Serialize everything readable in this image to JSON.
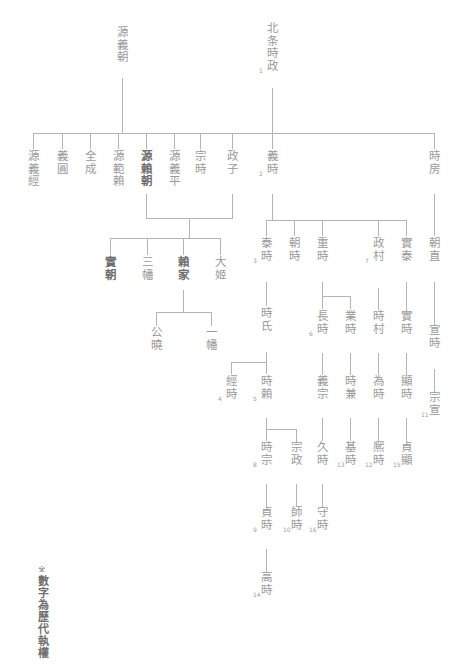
{
  "footnote": {
    "mark": "※",
    "text": "數字為歷代執權"
  },
  "legend": {
    "note": "數字為歷代執權",
    "meaning_marker": "※"
  },
  "colors": {
    "line": "#b4b4b4",
    "text": "#9a9a9a",
    "text_bold": "#6e6e6e",
    "background": "#ffffff"
  },
  "nodes": {
    "minamoto_yoshitomo": {
      "name": "源義朝",
      "number": ""
    },
    "minamoto_yoshitsune": {
      "name": "源義經",
      "number": ""
    },
    "gien": {
      "name": "義圓",
      "number": ""
    },
    "zenjo": {
      "name": "全成",
      "number": ""
    },
    "minamoto_noriyori": {
      "name": "源範賴",
      "number": ""
    },
    "minamoto_yoritomo": {
      "name": "源賴朝",
      "number": ""
    },
    "minamoto_yoshihira": {
      "name": "源義平",
      "number": ""
    },
    "hojo_tokimasa": {
      "name": "北条時政",
      "number": "1"
    },
    "munetoki": {
      "name": "宗時",
      "number": ""
    },
    "masako": {
      "name": "政子",
      "number": ""
    },
    "yoshitoki": {
      "name": "義時",
      "number": "2"
    },
    "tokifusa": {
      "name": "時房",
      "number": ""
    },
    "sanetomo": {
      "name": "實朝",
      "number": ""
    },
    "sanman": {
      "name": "三幡",
      "number": ""
    },
    "yoriie": {
      "name": "賴家",
      "number": ""
    },
    "ohime": {
      "name": "大姬",
      "number": ""
    },
    "kugyo": {
      "name": "公曉",
      "number": ""
    },
    "ichiman": {
      "name": "一幡",
      "number": ""
    },
    "yasutoki": {
      "name": "泰時",
      "number": "3"
    },
    "tomotoki": {
      "name": "朝時",
      "number": ""
    },
    "shigetoki": {
      "name": "重時",
      "number": ""
    },
    "masamura": {
      "name": "政村",
      "number": "7"
    },
    "saneyasu": {
      "name": "實泰",
      "number": ""
    },
    "tokiuji": {
      "name": "時氏",
      "number": ""
    },
    "nagatoki": {
      "name": "長時",
      "number": "6"
    },
    "naritoki": {
      "name": "業時",
      "number": ""
    },
    "tokimura": {
      "name": "時村",
      "number": ""
    },
    "sanetoki": {
      "name": "實時",
      "number": ""
    },
    "tsunetoki": {
      "name": "經時",
      "number": "4"
    },
    "tokiyori": {
      "name": "時賴",
      "number": "5"
    },
    "yoshimune": {
      "name": "義宗",
      "number": ""
    },
    "tokikane": {
      "name": "時兼",
      "number": ""
    },
    "tametoki": {
      "name": "為時",
      "number": ""
    },
    "akitoki": {
      "name": "顯時",
      "number": ""
    },
    "tokimune": {
      "name": "時宗",
      "number": "8"
    },
    "munemasa": {
      "name": "宗政",
      "number": ""
    },
    "hisatoki": {
      "name": "久時",
      "number": ""
    },
    "mototoki": {
      "name": "基時",
      "number": "13"
    },
    "hirotoki": {
      "name": "熈時",
      "number": "12"
    },
    "sadaaki": {
      "name": "貞顯",
      "number": "15"
    },
    "sadatoki": {
      "name": "貞時",
      "number": "9"
    },
    "morotoki": {
      "name": "師時",
      "number": "10"
    },
    "moritoki": {
      "name": "守時",
      "number": "16"
    },
    "takatoki": {
      "name": "高時",
      "number": "14"
    },
    "tomonao": {
      "name": "朝直",
      "number": ""
    },
    "nobutoki": {
      "name": "宣時",
      "number": ""
    },
    "munenobu": {
      "name": "宗宣",
      "number": "11"
    }
  }
}
